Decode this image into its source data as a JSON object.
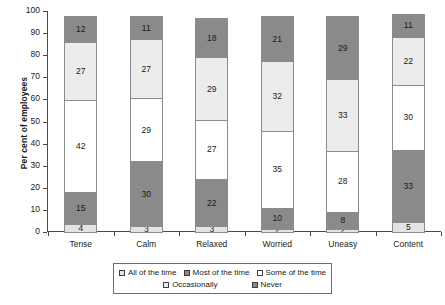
{
  "chart_data": {
    "type": "bar",
    "subtype": "stacked-bar-100",
    "title": "",
    "xlabel": "",
    "ylabel": "Per cent of employees",
    "ylim": [
      0,
      100
    ],
    "ytick_step": 10,
    "yticks": [
      "100",
      "90",
      "80",
      "70",
      "60",
      "50",
      "40",
      "30",
      "20",
      "10",
      "0"
    ],
    "grid": false,
    "legend_position": "bottom",
    "categories": [
      "Tense",
      "Calm",
      "Relaxed",
      "Worried",
      "Uneasy",
      "Content"
    ],
    "series": [
      {
        "name": "All of the time",
        "color": "#e3e3e3",
        "values": [
          4,
          3,
          3,
          2,
          2,
          5
        ]
      },
      {
        "name": "Most of the time",
        "color": "#8a8a8a",
        "values": [
          15,
          30,
          22,
          10,
          8,
          33
        ]
      },
      {
        "name": "Some of the time",
        "color": "#ffffff",
        "values": [
          42,
          29,
          27,
          35,
          28,
          30
        ]
      },
      {
        "name": "Occasionally",
        "color": "#ececec",
        "values": [
          27,
          27,
          29,
          32,
          33,
          22
        ]
      },
      {
        "name": "Never",
        "color": "#8a8a8a",
        "values": [
          12,
          11,
          18,
          21,
          29,
          11
        ]
      }
    ]
  },
  "legend": {
    "items": [
      {
        "label": "All of the time",
        "color": "#e3e3e3"
      },
      {
        "label": "Most of the time",
        "color": "#8a8a8a"
      },
      {
        "label": "Some of the time",
        "color": "#ffffff"
      },
      {
        "label": "Occasionally",
        "color": "#ececec"
      },
      {
        "label": "Never",
        "color": "#8a8a8a"
      }
    ]
  },
  "axis": {
    "y_title": "Per cent of employees"
  }
}
